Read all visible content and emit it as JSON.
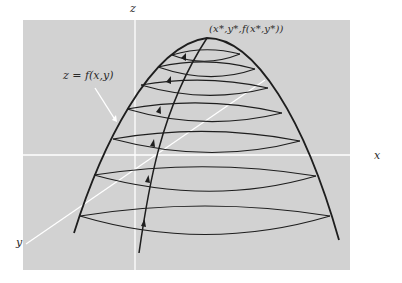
{
  "figure": {
    "type": "3d-surface-diagram",
    "colors": {
      "background": "#ffffff",
      "panel": "#d2d2d2",
      "axes": "#ffffff",
      "curves": "#1e1e1e",
      "annotation_arrow": "#ffffff"
    },
    "axes": {
      "x_label": "x",
      "y_label": "y",
      "z_label": "z"
    },
    "surface_label": "z = f(x,y)",
    "maximum_label": "(x*,y*,f(x*,y*))",
    "contour_count": 8,
    "path_arrow_count": 5
  }
}
